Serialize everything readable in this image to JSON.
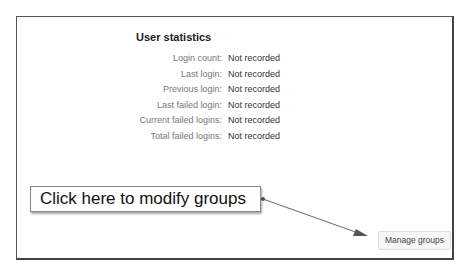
{
  "section": {
    "heading": "User statistics",
    "rows": [
      {
        "label": "Login count:",
        "value": "Not recorded"
      },
      {
        "label": "Last login:",
        "value": "Not recorded"
      },
      {
        "label": "Previous login:",
        "value": "Not recorded"
      },
      {
        "label": "Last failed login:",
        "value": "Not recorded"
      },
      {
        "label": "Current failed logins:",
        "value": "Not recorded"
      },
      {
        "label": "Total failed logins:",
        "value": "Not recorded"
      }
    ]
  },
  "annotation": {
    "callout_text": "Click here to modify groups",
    "arrow_color": "#555555"
  },
  "actions": {
    "manage_groups_label": "Manage groups"
  }
}
